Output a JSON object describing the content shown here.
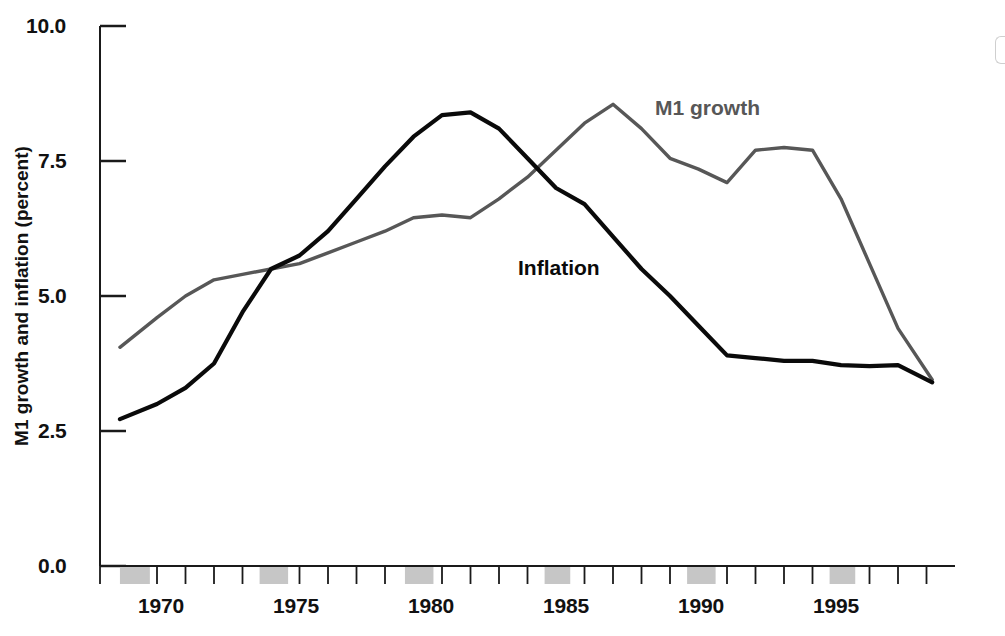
{
  "figure": {
    "title": "",
    "background_color": "#ffffff"
  },
  "axes": {
    "y_axis_label": "M1 growth and inflation (percent)",
    "y_tick_labels": [
      "10.0",
      "7.5",
      "5.0",
      "2.5",
      "0.0"
    ],
    "x_tick_labels": [
      "1970",
      "1975",
      "1980",
      "1985",
      "1990",
      "1995"
    ]
  },
  "annotations": {
    "m1_growth": "M1 growth",
    "inflation": "Inflation"
  },
  "colors": {
    "m1_growth_line": "#575757",
    "inflation_line": "#0a0a0a",
    "recession_band": "#c6c6c6",
    "axis": "#1a1a1a"
  },
  "chart_data": {
    "type": "line",
    "title": "",
    "xlabel": "",
    "ylabel": "M1 growth and inflation (percent)",
    "xlim": [
      1969,
      1999
    ],
    "ylim": [
      0.0,
      10.0
    ],
    "y_ticks": [
      0.0,
      2.5,
      5.0,
      7.5,
      10.0
    ],
    "x_ticks": [
      1970,
      1975,
      1980,
      1985,
      1990,
      1995
    ],
    "x_minor_ticks": [
      1969,
      1970,
      1971,
      1972,
      1973,
      1974,
      1975,
      1976,
      1977,
      1978,
      1979,
      1980,
      1981,
      1982,
      1983,
      1984,
      1985,
      1986,
      1987,
      1988,
      1989,
      1990,
      1991,
      1992,
      1993,
      1994,
      1995,
      1996,
      1997,
      1998
    ],
    "grid": false,
    "legend_position": "inline-annotations",
    "x": [
      1969.7,
      1971,
      1972,
      1973,
      1974,
      1975,
      1976,
      1977,
      1978,
      1979,
      1980,
      1981,
      1982,
      1983,
      1984,
      1985,
      1986,
      1987,
      1988,
      1989,
      1990,
      1991,
      1992,
      1993,
      1994,
      1995,
      1996,
      1997,
      1998.2
    ],
    "series": [
      {
        "name": "M1 growth",
        "color": "#575757",
        "values": [
          4.05,
          4.6,
          5.0,
          5.3,
          5.4,
          5.5,
          5.6,
          5.8,
          6.0,
          6.2,
          6.45,
          6.5,
          6.45,
          6.8,
          7.2,
          7.7,
          8.2,
          8.55,
          8.1,
          7.55,
          7.35,
          7.1,
          7.7,
          7.75,
          7.7,
          6.8,
          5.6,
          4.4,
          3.45
        ]
      },
      {
        "name": "Inflation",
        "color": "#0a0a0a",
        "values": [
          2.72,
          3.0,
          3.3,
          3.75,
          4.7,
          5.5,
          5.75,
          6.2,
          6.8,
          7.4,
          7.95,
          8.35,
          8.4,
          8.1,
          7.55,
          7.0,
          6.7,
          6.1,
          5.5,
          5.0,
          4.45,
          3.9,
          3.85,
          3.8,
          3.8,
          3.72,
          3.7,
          3.72,
          3.4
        ]
      }
    ],
    "recession_bands": [
      {
        "start": 1969.7,
        "end": 1970.75
      },
      {
        "start": 1974.6,
        "end": 1975.6
      },
      {
        "start": 1979.7,
        "end": 1980.7
      },
      {
        "start": 1984.6,
        "end": 1985.5
      },
      {
        "start": 1989.6,
        "end": 1990.6
      },
      {
        "start": 1994.6,
        "end": 1995.5
      }
    ]
  }
}
